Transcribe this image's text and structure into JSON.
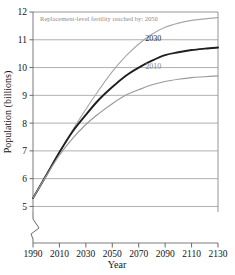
{
  "chart_data": {
    "type": "line",
    "title": "",
    "xlabel": "Year",
    "ylabel": "Population (billions)",
    "xlim": [
      1990,
      2130
    ],
    "ylim": [
      4.8,
      12
    ],
    "grid": true,
    "axis_break_y": true,
    "legend_position": "inline-annotations",
    "annotation": "Replacement-level fertility reached by: 2050",
    "xticks": [
      "1990",
      "2010",
      "2030",
      "2050",
      "2070",
      "2090",
      "2110",
      "2130"
    ],
    "xtick_values": [
      1990,
      2010,
      2030,
      2050,
      2070,
      2090,
      2110,
      2130
    ],
    "yticks": [
      "5",
      "6",
      "7",
      "8",
      "9",
      "10",
      "11",
      "12"
    ],
    "ytick_values": [
      5,
      6,
      7,
      8,
      9,
      10,
      11,
      12
    ],
    "x": [
      1990,
      2000,
      2010,
      2020,
      2030,
      2040,
      2050,
      2060,
      2070,
      2080,
      2090,
      2100,
      2110,
      2120,
      2130
    ],
    "series": [
      {
        "name": "2050",
        "label": "Replacement-level fertility reached by: 2050",
        "color": "#a8a8a8",
        "label_x": 2130,
        "label_y": 11.75,
        "values": [
          5.3,
          6.1,
          6.95,
          7.75,
          8.5,
          9.2,
          9.85,
          10.4,
          10.85,
          11.2,
          11.45,
          11.6,
          11.7,
          11.75,
          11.8
        ]
      },
      {
        "name": "2030",
        "label": "2030",
        "color": "#1f1f1f",
        "label_x": 2081,
        "label_y": 10.95,
        "values": [
          5.3,
          6.12,
          6.95,
          7.7,
          8.3,
          8.85,
          9.3,
          9.7,
          10.0,
          10.25,
          10.45,
          10.55,
          10.63,
          10.68,
          10.72
        ]
      },
      {
        "name": "2010",
        "label": "2010",
        "color": "#9a9a9a",
        "label_x": 2081,
        "label_y": 9.95,
        "values": [
          5.3,
          6.1,
          6.85,
          7.45,
          7.95,
          8.35,
          8.7,
          9.0,
          9.2,
          9.38,
          9.5,
          9.58,
          9.64,
          9.67,
          9.7
        ]
      }
    ]
  },
  "axes": {
    "y_title": "Population (billions)",
    "x_title": "Year"
  }
}
